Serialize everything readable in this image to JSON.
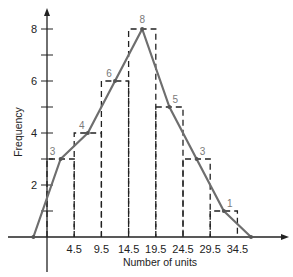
{
  "chart_data": {
    "type": "line",
    "subtype": "frequency polygon over histogram",
    "title": "",
    "xlabel": "Number of units",
    "ylabel": "Frequency",
    "class_boundaries": [
      -0.5,
      4.5,
      9.5,
      14.5,
      19.5,
      24.5,
      29.5,
      34.5
    ],
    "x_tick_labels": [
      "4.5",
      "9.5",
      "14.5",
      "19.5",
      "24.5",
      "29.5",
      "34.5"
    ],
    "y_tick_labels": [
      "2",
      "4",
      "6",
      "8"
    ],
    "y_ticks_minor": [
      1,
      3,
      5,
      7
    ],
    "histogram": {
      "style": "dashed",
      "bins": [
        {
          "from": -0.5,
          "to": 4.5,
          "frequency": 3
        },
        {
          "from": 4.5,
          "to": 9.5,
          "frequency": 4
        },
        {
          "from": 9.5,
          "to": 14.5,
          "frequency": 6
        },
        {
          "from": 14.5,
          "to": 19.5,
          "frequency": 8
        },
        {
          "from": 19.5,
          "to": 24.5,
          "frequency": 5
        },
        {
          "from": 24.5,
          "to": 29.5,
          "frequency": 3
        },
        {
          "from": 29.5,
          "to": 34.5,
          "frequency": 1
        }
      ]
    },
    "series": [
      {
        "name": "Frequency polygon",
        "x": [
          -3,
          2,
          7,
          12,
          17,
          22,
          27,
          32,
          37
        ],
        "values": [
          0,
          3,
          4,
          6,
          8,
          5,
          3,
          1,
          0
        ]
      }
    ],
    "point_labels": [
      "3",
      "4",
      "6",
      "8",
      "5",
      "3",
      "1"
    ],
    "xlim": [
      -5.5,
      45
    ],
    "ylim": [
      -2,
      9
    ],
    "grid": false,
    "legend": "none"
  },
  "colors": {
    "polygon": "#6e6e6e",
    "axes": "#222222",
    "histogram": "#222222",
    "point_label": "#7a7a7a"
  }
}
